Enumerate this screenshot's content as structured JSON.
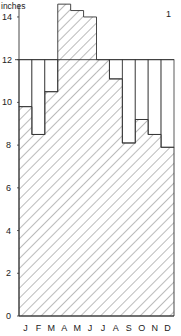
{
  "chart_data": {
    "type": "bar",
    "title": "",
    "panel_label": "1",
    "ylabel": "inches",
    "xlabel": "",
    "ylim": [
      0,
      14.6
    ],
    "yticks": [
      0,
      2,
      4,
      6,
      8,
      10,
      12,
      14
    ],
    "categories": [
      "J",
      "F",
      "M",
      "A",
      "M",
      "J",
      "J",
      "A",
      "S",
      "O",
      "N",
      "D"
    ],
    "reference_line": 12,
    "series": [
      {
        "name": "monthly value (hatched)",
        "values": [
          9.8,
          8.5,
          10.5,
          14.6,
          14.3,
          14.0,
          12.0,
          11.1,
          8.1,
          9.2,
          8.5,
          7.9
        ]
      },
      {
        "name": "reference level (open)",
        "values": [
          12,
          12,
          12,
          12,
          12,
          12,
          12,
          12,
          12,
          12,
          12,
          12
        ]
      }
    ],
    "grid": false,
    "legend": "none"
  }
}
